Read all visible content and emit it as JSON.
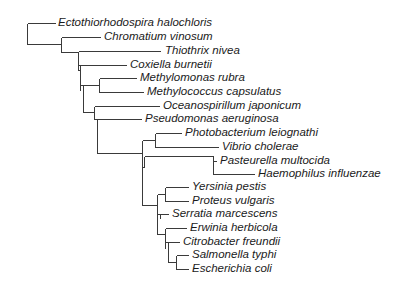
{
  "diagram": {
    "type": "phylogenetic-tree",
    "line_color": "#3a3a3a",
    "text_color": "#1a1a1a",
    "taxa": [
      {
        "label": "Ectothiorhodospira halochloris",
        "x": 58,
        "y": 23
      },
      {
        "label": "Chromatium vinosum",
        "x": 104,
        "y": 37
      },
      {
        "label": "Thiothrix nivea",
        "x": 165,
        "y": 51
      },
      {
        "label": "Coxiella burnetii",
        "x": 130,
        "y": 65
      },
      {
        "label": "Methylomonas rubra",
        "x": 140,
        "y": 78
      },
      {
        "label": "Methylococcus capsulatus",
        "x": 147,
        "y": 92
      },
      {
        "label": "Oceanospirillum japonicum",
        "x": 163,
        "y": 106
      },
      {
        "label": "Pseudomonas aeruginosa",
        "x": 145,
        "y": 119
      },
      {
        "label": "Photobacterium leiognathi",
        "x": 185,
        "y": 133
      },
      {
        "label": "Vibrio cholerae",
        "x": 222,
        "y": 147
      },
      {
        "label": "Pasteurella multocida",
        "x": 220,
        "y": 161
      },
      {
        "label": "Haemophilus influenzae",
        "x": 258,
        "y": 174
      },
      {
        "label": "Yersinia pestis",
        "x": 192,
        "y": 187
      },
      {
        "label": "Proteus vulgaris",
        "x": 192,
        "y": 201
      },
      {
        "label": "Serratia marcescens",
        "x": 172,
        "y": 214
      },
      {
        "label": "Erwinia herbicola",
        "x": 190,
        "y": 228
      },
      {
        "label": "Citrobacter freundii",
        "x": 183,
        "y": 242
      },
      {
        "label": "Salmonella typhi",
        "x": 192,
        "y": 255
      },
      {
        "label": "Escherichia coli",
        "x": 192,
        "y": 269
      }
    ],
    "branches": [
      [
        27,
        23,
        27,
        44
      ],
      [
        27,
        23,
        55,
        23
      ],
      [
        27,
        44,
        61,
        44
      ],
      [
        61,
        37,
        61,
        52
      ],
      [
        61,
        37,
        100,
        37
      ],
      [
        61,
        52,
        78,
        52
      ],
      [
        78,
        51,
        78,
        70
      ],
      [
        78,
        51,
        160,
        51
      ],
      [
        78,
        65,
        126,
        65
      ],
      [
        78,
        70,
        80,
        70
      ],
      [
        80,
        65,
        80,
        90
      ],
      [
        80,
        85,
        83,
        85
      ],
      [
        83,
        85,
        83,
        112
      ],
      [
        83,
        85,
        99,
        85
      ],
      [
        99,
        78,
        99,
        92
      ],
      [
        99,
        78,
        136,
        78
      ],
      [
        99,
        92,
        143,
        92
      ],
      [
        83,
        112,
        94,
        112
      ],
      [
        94,
        106,
        94,
        119
      ],
      [
        94,
        106,
        159,
        106
      ],
      [
        94,
        119,
        97,
        119
      ],
      [
        97,
        119,
        97,
        153
      ],
      [
        97,
        119,
        141,
        119
      ],
      [
        97,
        153,
        142,
        153
      ],
      [
        142,
        140,
        142,
        205
      ],
      [
        142,
        140,
        155,
        140
      ],
      [
        155,
        133,
        155,
        147
      ],
      [
        155,
        133,
        181,
        133
      ],
      [
        155,
        147,
        218,
        147
      ],
      [
        142,
        167,
        144,
        167
      ],
      [
        144,
        156,
        144,
        167
      ],
      [
        144,
        156,
        213,
        156
      ],
      [
        213,
        156,
        213,
        174
      ],
      [
        213,
        161,
        216,
        161
      ],
      [
        213,
        174,
        254,
        174
      ],
      [
        142,
        205,
        157,
        205
      ],
      [
        157,
        194,
        157,
        234
      ],
      [
        157,
        194,
        165,
        194
      ],
      [
        165,
        187,
        165,
        201
      ],
      [
        165,
        187,
        188,
        187
      ],
      [
        165,
        201,
        188,
        201
      ],
      [
        157,
        214,
        160,
        214
      ],
      [
        160,
        214,
        160,
        218
      ],
      [
        160,
        214,
        168,
        214
      ],
      [
        157,
        234,
        165,
        234
      ],
      [
        165,
        228,
        165,
        248
      ],
      [
        165,
        228,
        186,
        228
      ],
      [
        165,
        242,
        168,
        242
      ],
      [
        168,
        242,
        168,
        262
      ],
      [
        168,
        242,
        179,
        242
      ],
      [
        168,
        262,
        176,
        262
      ],
      [
        176,
        255,
        176,
        269
      ],
      [
        176,
        255,
        188,
        255
      ],
      [
        176,
        269,
        188,
        269
      ]
    ]
  }
}
